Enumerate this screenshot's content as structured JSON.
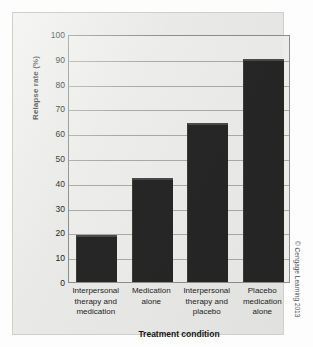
{
  "chart_data": {
    "type": "bar",
    "title": "",
    "xlabel": "Treatment condition",
    "ylabel": "Relapse rate (%)",
    "categories": [
      "Interpersonal therapy and medication",
      "Medication alone",
      "Interpersonal therapy and placebo",
      "Placebo medication alone"
    ],
    "category_lines": [
      [
        "Interpersonal",
        "therapy and",
        "medication"
      ],
      [
        "Medication",
        "alone"
      ],
      [
        "Interpersonal",
        "therapy and",
        "placebo"
      ],
      [
        "Placebo",
        "medication",
        "alone"
      ]
    ],
    "values": [
      19,
      42,
      64,
      90
    ],
    "ylim": [
      0,
      100
    ],
    "ytick_values": [
      0,
      10,
      20,
      30,
      40,
      50,
      60,
      70,
      80,
      90,
      100
    ],
    "ytick_labels": [
      "0",
      "10",
      "20",
      "30",
      "40",
      "50",
      "60",
      "70",
      "80",
      "90",
      "100"
    ],
    "grid": true,
    "legend": "none",
    "bar_color": "#262626",
    "plot_background": "#ececeb",
    "panel_background": "#e9e9e7",
    "gridline_color": "#a9a9a6",
    "axis_color": "#8d8d8a"
  },
  "credit": {
    "text": "© Cengage Learning 2013"
  }
}
